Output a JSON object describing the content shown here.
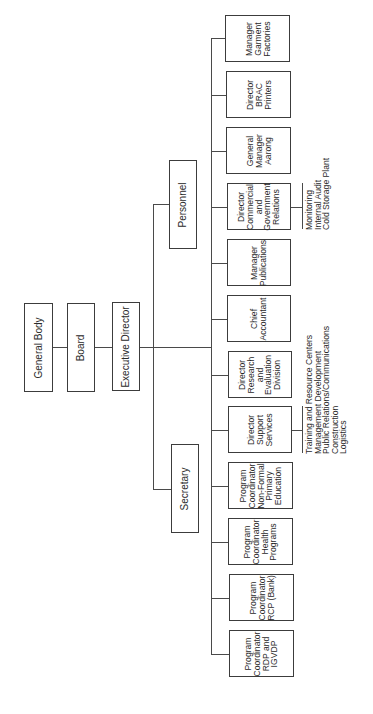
{
  "chart_title": "",
  "top_chain": [
    {
      "id": "general-body",
      "label": "General Body"
    },
    {
      "id": "board",
      "label": "Board"
    },
    {
      "id": "executive-director",
      "label": "Executive Director"
    }
  ],
  "staff": [
    {
      "id": "personnel",
      "label": "Personnel"
    },
    {
      "id": "secretary",
      "label": "Secretary"
    }
  ],
  "units": [
    {
      "id": "manager-garment-factories",
      "lines": [
        "Manager",
        "Garment",
        "Factories"
      ]
    },
    {
      "id": "director-brac-printers",
      "lines": [
        "Director",
        "BRAC",
        "Printers"
      ]
    },
    {
      "id": "general-manager-aarong",
      "lines": [
        "General",
        "Manager",
        "Aarong"
      ]
    },
    {
      "id": "director-commercial-government-relations",
      "lines": [
        "Director",
        "Commercial",
        "and",
        "Government",
        "Relations"
      ],
      "notes": [
        "Monitoring",
        "Internal Audit",
        "Cold Storage Plant"
      ]
    },
    {
      "id": "manager-publications",
      "lines": [
        "Manager",
        "Publications"
      ]
    },
    {
      "id": "chief-accountant",
      "lines": [
        "Chief",
        "Accountant"
      ]
    },
    {
      "id": "director-research-evaluation",
      "lines": [
        "Director",
        "Research",
        "and",
        "Evaluation",
        "Division"
      ]
    },
    {
      "id": "director-support-services",
      "lines": [
        "Director",
        "Support",
        "Services"
      ],
      "notes": [
        "Training and Resource Centers",
        "Management Development",
        "Public Relations/Communications",
        "Construction",
        "Logistics"
      ]
    },
    {
      "id": "pc-non-formal-primary-education",
      "lines": [
        "Program",
        "Coordinator",
        "Non-Formal",
        "Primary",
        "Education"
      ]
    },
    {
      "id": "pc-health-programs",
      "lines": [
        "Program",
        "Coordinator",
        "Health",
        "Programs"
      ]
    },
    {
      "id": "pc-rcp-bank",
      "lines": [
        "Program",
        "Coordinator",
        "RCP (Bank)"
      ]
    },
    {
      "id": "pc-rdp-igvdp",
      "lines": [
        "Program",
        "Coordinator",
        "RDP and",
        "IGVDP"
      ]
    }
  ],
  "colors": {
    "line": "#4a4a4a",
    "border": "#3c3c3c",
    "text": "#2a2a2a",
    "background": "#ffffff"
  }
}
